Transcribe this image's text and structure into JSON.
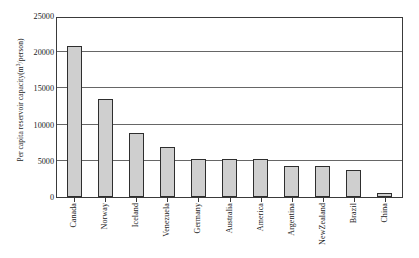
{
  "chart_data": {
    "type": "bar",
    "title": "",
    "subtitle": "",
    "xlabel": "",
    "ylabel": "Per capita reservoir capacity(m3/person)",
    "ylabel_prefix": "Per capita reservoir capacity(m",
    "ylabel_superscript": "3",
    "ylabel_suffix": "/person)",
    "categories": [
      "Canada",
      "Norway",
      "Iceland",
      "Venezuela",
      "Germany",
      "Australia",
      "America",
      "Argentina",
      "NewZealand",
      "Brazil",
      "China"
    ],
    "values": [
      20900,
      13500,
      8800,
      6900,
      5300,
      5200,
      5200,
      4300,
      4300,
      3800,
      550
    ],
    "ylim": [
      0,
      25000
    ],
    "yticks": [
      0,
      5000,
      10000,
      15000,
      20000,
      25000
    ],
    "ytick_labels": [
      "0",
      "5000",
      "10000",
      "15000",
      "20000",
      "25000"
    ],
    "grid": true,
    "grid_axis": "y",
    "legend": false,
    "legend_position": "none",
    "bar_fill_color": "#cfcfcf",
    "bar_border_color": "#2e2e2e",
    "gridline_color": "#666666",
    "axis_color": "#3a3a3a",
    "background_color": "#ffffff"
  }
}
